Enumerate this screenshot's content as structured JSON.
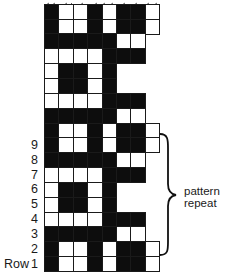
{
  "diagram": {
    "type": "pattern-grid",
    "columns": 8,
    "legend": {
      "B": "filled (dark)",
      "W": "open (white)"
    },
    "colors": {
      "filled": "#0d0d0d",
      "open": "#ffffff",
      "line": "#1a1a1a"
    },
    "rows_top_to_bottom": [
      "BWWBWBBW",
      "BWWBWBBW",
      "BBBBBWW",
      "WWWWBBB",
      "WBBWB",
      "WBBWB",
      "WWWWBBB",
      "BBBBBWW",
      "BWWBWBBW",
      "BWWBWBBW",
      "BBBBBWW",
      "WWWWBBB",
      "WBBWB",
      "WBBWB",
      "WWWWBBB",
      "BBBBBWW",
      "BWWBWBBW",
      "BWWBWBBW"
    ],
    "row_labels": [
      {
        "text": "9",
        "row_from_bottom": 9
      },
      {
        "text": "8",
        "row_from_bottom": 8
      },
      {
        "text": "7",
        "row_from_bottom": 7
      },
      {
        "text": "6",
        "row_from_bottom": 6
      },
      {
        "text": "5",
        "row_from_bottom": 5
      },
      {
        "text": "4",
        "row_from_bottom": 4
      },
      {
        "text": "3",
        "row_from_bottom": 3
      },
      {
        "text": "2",
        "row_from_bottom": 2
      },
      {
        "text": "1",
        "row_from_bottom": 1
      }
    ],
    "row_word": "Row",
    "repeat": {
      "label_line1": "pattern",
      "label_line2": "repeat",
      "from_row": 2,
      "to_row": 9
    }
  }
}
